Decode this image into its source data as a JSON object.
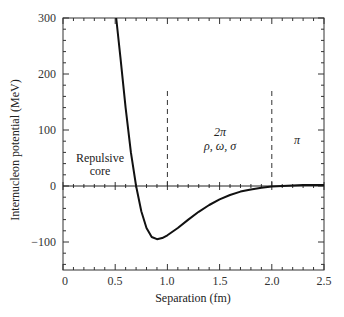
{
  "chart_data": {
    "type": "line",
    "title": "",
    "xlabel": "Separation (fm)",
    "ylabel": "Internucleon potential (MeV)",
    "xlim": [
      0,
      2.5
    ],
    "ylim": [
      -150,
      300
    ],
    "x_ticks": [
      0,
      0.5,
      1.0,
      1.5,
      2.0,
      2.5
    ],
    "x_tick_labels": [
      "0",
      "0.5",
      "1.0",
      "1.5",
      "2.0",
      "2.5"
    ],
    "y_ticks": [
      -100,
      0,
      100,
      200,
      300
    ],
    "y_tick_labels": [
      "−100",
      "0",
      "100",
      "200",
      "300"
    ],
    "grid": false,
    "legend": null,
    "series": [
      {
        "name": "Nucleon-nucleon potential",
        "color": "#111111",
        "x": [
          0.51,
          0.55,
          0.6,
          0.65,
          0.7,
          0.75,
          0.8,
          0.85,
          0.9,
          0.95,
          1.0,
          1.1,
          1.2,
          1.3,
          1.4,
          1.5,
          1.6,
          1.7,
          1.8,
          1.9,
          2.0,
          2.1,
          2.2,
          2.3,
          2.4,
          2.5
        ],
        "y": [
          300,
          230,
          140,
          60,
          0,
          -45,
          -75,
          -91,
          -95,
          -93,
          -88,
          -75,
          -60,
          -46,
          -34,
          -24,
          -16,
          -10,
          -6,
          -3,
          -1,
          0,
          1,
          2,
          2,
          2
        ]
      }
    ],
    "reference_lines": [
      {
        "type": "horizontal",
        "y": 0,
        "style": "solid"
      },
      {
        "type": "vertical",
        "x": 1.0,
        "y_range": [
          0,
          170
        ],
        "style": "dashed"
      },
      {
        "type": "vertical",
        "x": 2.0,
        "y_range": [
          0,
          170
        ],
        "style": "dashed"
      }
    ],
    "annotations": [
      {
        "text": "Repulsive",
        "x": 0.15,
        "y": 50
      },
      {
        "text": "core",
        "x": 0.3,
        "y": 22
      },
      {
        "text": "2π",
        "x": 1.5,
        "y": 95
      },
      {
        "text": "ρ, ω, σ",
        "x": 1.5,
        "y": 68
      },
      {
        "text": "π",
        "x": 2.25,
        "y": 75
      }
    ]
  },
  "labels": {
    "xlabel": "Separation (fm)",
    "ylabel": "Internucleon potential (MeV)",
    "repulsive": "Repulsive",
    "core": "core",
    "two_pi": "2π",
    "mesons": "ρ, ω, σ",
    "pi": "π",
    "x0": "0",
    "x1": "0.5",
    "x2": "1.0",
    "x3": "1.5",
    "x4": "2.0",
    "x5": "2.5",
    "ym100": "−100",
    "y0": "0",
    "y100": "100",
    "y200": "200",
    "y300": "300"
  }
}
